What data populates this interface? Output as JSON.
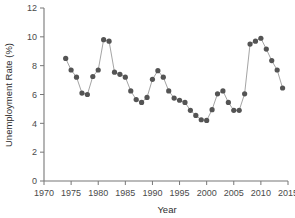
{
  "chart_data": {
    "type": "line",
    "title": "",
    "subtitle": "",
    "xlabel": "Year",
    "ylabel": "Unemployment Rate (%)",
    "xlim": [
      1970,
      2015
    ],
    "ylim": [
      0,
      12
    ],
    "xticks": [
      1970,
      1975,
      1980,
      1985,
      1990,
      1995,
      2000,
      2005,
      2010,
      2015
    ],
    "yticks": [
      0,
      2,
      4,
      6,
      8,
      10,
      12
    ],
    "xtick_labels": [
      "1970",
      "1975",
      "1980",
      "1985",
      "1990",
      "1995",
      "2000",
      "2005",
      "2010",
      "2015"
    ],
    "ytick_labels": [
      "0",
      "2",
      "4",
      "6",
      "8",
      "10",
      "12"
    ],
    "grid": false,
    "legend": null,
    "legend_position": "none",
    "marker": "circle",
    "marker_color": "#545454",
    "line_color": "#9a9a9a",
    "series": [
      {
        "name": "Unemployment Rate",
        "x": [
          1974,
          1975,
          1976,
          1977,
          1978,
          1979,
          1980,
          1981,
          1982,
          1983,
          1984,
          1985,
          1986,
          1987,
          1988,
          1989,
          1990,
          1991,
          1992,
          1993,
          1994,
          1995,
          1996,
          1997,
          1998,
          1999,
          2000,
          2001,
          2002,
          2003,
          2004,
          2005,
          2006,
          2007,
          2008,
          2009,
          2010,
          2011,
          2012,
          2013,
          2014
        ],
        "values": [
          8.5,
          7.7,
          7.2,
          6.1,
          6.0,
          7.25,
          7.7,
          9.8,
          9.7,
          7.55,
          7.4,
          7.2,
          6.25,
          5.65,
          5.45,
          5.8,
          7.05,
          7.65,
          7.2,
          6.25,
          5.75,
          5.6,
          5.45,
          4.9,
          4.55,
          4.25,
          4.2,
          4.95,
          6.05,
          6.25,
          5.45,
          4.9,
          4.9,
          6.05,
          9.5,
          9.7,
          9.9,
          9.15,
          8.35,
          7.7,
          6.45
        ]
      }
    ]
  },
  "axes": {
    "y_title": "Unemployment Rate (%)",
    "x_title": "Year"
  }
}
